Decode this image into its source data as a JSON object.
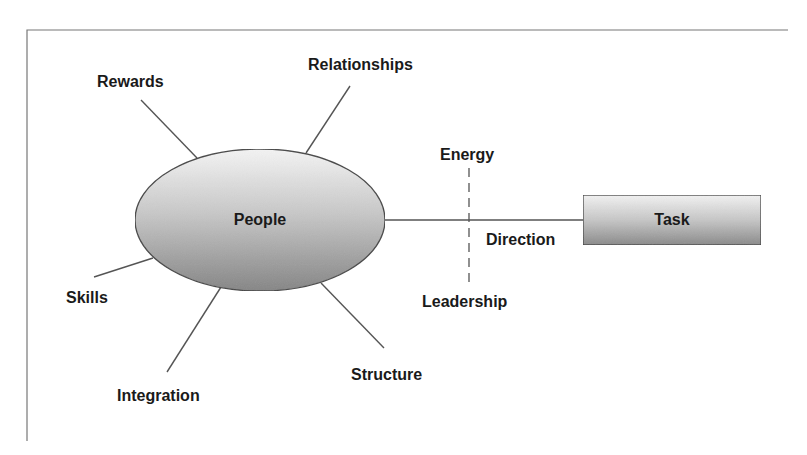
{
  "diagram": {
    "type": "hub-and-spoke",
    "frame": {
      "left": 27,
      "top": 30,
      "right": 788,
      "bottom": 441,
      "stroke": "#777777"
    },
    "colors": {
      "line": "#555555",
      "text": "#1a1a1a",
      "fill_light": "#f2f2f2",
      "fill_dark": "#8c8c8c",
      "outline": "#444444"
    },
    "hub": {
      "label": "People",
      "shape": "ellipse",
      "cx": 260,
      "cy": 220,
      "rx": 125,
      "ry": 71
    },
    "spokes": [
      {
        "label": "Rewards",
        "x1": 197,
        "y1": 158,
        "x2": 141,
        "y2": 100,
        "tx": 97,
        "ty": 87
      },
      {
        "label": "Relationships",
        "x1": 306,
        "y1": 153,
        "x2": 350,
        "y2": 86,
        "tx": 308,
        "ty": 70
      },
      {
        "label": "Skills",
        "x1": 153,
        "y1": 258,
        "x2": 94,
        "y2": 277,
        "tx": 66,
        "ty": 303
      },
      {
        "label": "Integration",
        "x1": 221,
        "y1": 287,
        "x2": 167,
        "y2": 372,
        "tx": 117,
        "ty": 401
      },
      {
        "label": "Structure",
        "x1": 321,
        "y1": 283,
        "x2": 384,
        "y2": 348,
        "tx": 351,
        "ty": 380
      }
    ],
    "connector": {
      "x1": 385,
      "y1": 220,
      "x2": 583,
      "y2": 220,
      "label": "Direction",
      "tx": 486,
      "ty": 245
    },
    "divider": {
      "style": "dashed",
      "x": 469,
      "y1": 168,
      "y2": 285,
      "top_label": "Energy",
      "top_tx": 440,
      "top_ty": 160,
      "bottom_label": "Leadership",
      "bottom_tx": 422,
      "bottom_ty": 307
    },
    "target": {
      "label": "Task",
      "shape": "rectangle",
      "x": 583,
      "y": 195,
      "w": 178,
      "h": 50
    }
  }
}
